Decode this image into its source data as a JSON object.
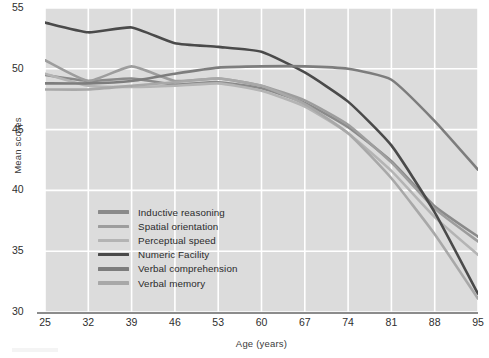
{
  "chart_data": {
    "type": "line",
    "title": "",
    "xlabel": "Age (years)",
    "ylabel": "Mean scores",
    "x": [
      25,
      32,
      39,
      46,
      53,
      60,
      67,
      74,
      81,
      88,
      95
    ],
    "categories": [
      "25",
      "32",
      "39",
      "46",
      "53",
      "60",
      "67",
      "74",
      "81",
      "88",
      "95"
    ],
    "xlim": [
      25,
      95
    ],
    "ylim": [
      30,
      55
    ],
    "xticks": [
      25,
      32,
      39,
      46,
      53,
      60,
      67,
      74,
      81,
      88,
      95
    ],
    "yticks": [
      30,
      35,
      40,
      45,
      50,
      55
    ],
    "grid": "both, white lines on light gray panel",
    "legend_position": "inside lower-left of plot area",
    "series": [
      {
        "name": "Inductive reasoning",
        "color": "#8a8a8a",
        "values": [
          49.5,
          49.0,
          49.2,
          48.7,
          48.9,
          48.4,
          47.2,
          45.2,
          42.4,
          38.7,
          36.2
        ]
      },
      {
        "name": "Spatial orientation",
        "color": "#9d9d9d",
        "values": [
          50.7,
          49.0,
          50.2,
          49.0,
          49.2,
          48.6,
          47.4,
          45.4,
          42.3,
          38.5,
          35.8
        ]
      },
      {
        "name": "Perceptual speed",
        "color": "#b4b4b4",
        "values": [
          49.6,
          48.6,
          48.5,
          48.6,
          48.8,
          48.2,
          46.9,
          44.7,
          41.6,
          37.8,
          34.7
        ]
      },
      {
        "name": "Numeric Facility",
        "color": "#4a4a4a",
        "values": [
          53.8,
          53.0,
          53.4,
          52.1,
          51.8,
          51.4,
          49.7,
          47.3,
          43.7,
          38.2,
          31.5
        ]
      },
      {
        "name": "Verbal comprehension",
        "color": "#7d7d7d",
        "values": [
          48.8,
          48.8,
          49.0,
          49.6,
          50.1,
          50.2,
          50.2,
          50.0,
          49.1,
          45.7,
          41.7
        ]
      },
      {
        "name": "Verbal memory",
        "color": "#a8a8a8",
        "values": [
          48.3,
          48.3,
          48.6,
          48.9,
          49.2,
          48.6,
          47.1,
          44.7,
          41.0,
          36.4,
          31.1
        ]
      }
    ]
  },
  "axes": {
    "ylabel": "Mean scores",
    "xlabel": "Age (years)",
    "ytick_labels": [
      "55",
      "50",
      "45",
      "40",
      "35",
      "30"
    ],
    "xtick_labels": [
      "25",
      "32",
      "39",
      "46",
      "53",
      "60",
      "67",
      "74",
      "81",
      "88",
      "95"
    ]
  },
  "legend": {
    "items": [
      {
        "label": "Inductive reasoning",
        "color": "#8a8a8a"
      },
      {
        "label": "Spatial orientation",
        "color": "#9d9d9d"
      },
      {
        "label": "Perceptual speed",
        "color": "#b4b4b4"
      },
      {
        "label": "Numeric Facility",
        "color": "#4a4a4a"
      },
      {
        "label": "Verbal comprehension",
        "color": "#7d7d7d"
      },
      {
        "label": "Verbal memory",
        "color": "#a8a8a8"
      }
    ]
  },
  "style": {
    "panel_background": "#dcdcdc",
    "gridline_color": "#ffffff",
    "axis_color": "#8c8c8c",
    "text_color": "#2e2e2e"
  }
}
